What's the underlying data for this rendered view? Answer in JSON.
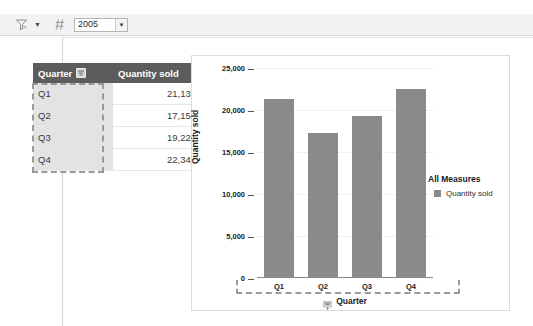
{
  "toolbar": {
    "filter_icon": "filter-funnel-icon",
    "dropdown_caret": "▼",
    "parameter_icon": "parameter-icon",
    "year_select": {
      "value": "2005",
      "caret": "▼"
    }
  },
  "table": {
    "columns": [
      {
        "key": "quarter",
        "label": "Quarter",
        "icon": "sort-filter-icon"
      },
      {
        "key": "quantity",
        "label": "Quantity sold"
      }
    ],
    "rows": [
      {
        "quarter": "Q1",
        "quantity": "21,135"
      },
      {
        "quarter": "Q2",
        "quantity": "17,152"
      },
      {
        "quarter": "Q3",
        "quantity": "19,224"
      },
      {
        "quarter": "Q4",
        "quantity": "22,344"
      }
    ]
  },
  "chart_panel": {
    "xaxis_icon": "sort-filter-icon",
    "legend": {
      "title": "All Measures",
      "entries": [
        {
          "label": "Quantity sold",
          "color": "#8a8a8a"
        }
      ]
    }
  },
  "chart_data": {
    "type": "bar",
    "title": "",
    "categories": [
      "Q1",
      "Q2",
      "Q3",
      "Q4"
    ],
    "values": [
      21135,
      17152,
      19224,
      22344
    ],
    "series": [
      {
        "name": "Quantity sold",
        "values": [
          21135,
          17152,
          19224,
          22344
        ]
      }
    ],
    "xlabel": "Quarter",
    "ylabel": "Quantity sold",
    "ylim": [
      0,
      25000
    ],
    "yticks": [
      0,
      5000,
      10000,
      15000,
      20000,
      25000
    ],
    "ytick_labels": [
      "0",
      "5,000",
      "10,000",
      "15,000",
      "20,000",
      "25,000"
    ],
    "grid": true,
    "legend_position": "right",
    "bar_color": "#8a8a8a"
  },
  "colors": {
    "header_bg": "#5c5c5c",
    "selection": "#9a9a9a",
    "bar": "#8a8a8a",
    "toolbar_bg": "#f2f2f2"
  }
}
